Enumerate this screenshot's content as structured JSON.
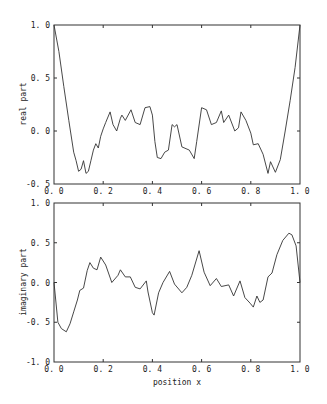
{
  "chart_data": [
    {
      "type": "line",
      "title": "",
      "xlabel": "",
      "ylabel": "real part",
      "xlim": [
        0.0,
        1.0
      ],
      "ylim": [
        -0.5,
        1.0
      ],
      "xticks": [
        "0.0",
        "0.2",
        "0.4",
        "0.6",
        "0.8",
        "1.0"
      ],
      "yticks": [
        "-0.5",
        "0.0",
        "0.5",
        "1.0"
      ],
      "grid": false,
      "legend": null,
      "series": [
        {
          "name": "real part",
          "x": [
            0.0,
            0.02,
            0.04,
            0.06,
            0.08,
            0.09,
            0.1,
            0.11,
            0.12,
            0.13,
            0.14,
            0.15,
            0.16,
            0.17,
            0.18,
            0.19,
            0.2,
            0.21,
            0.228,
            0.24,
            0.255,
            0.27,
            0.276,
            0.29,
            0.313,
            0.33,
            0.35,
            0.37,
            0.39,
            0.4,
            0.41,
            0.42,
            0.435,
            0.45,
            0.465,
            0.48,
            0.49,
            0.5,
            0.52,
            0.55,
            0.57,
            0.58,
            0.6,
            0.62,
            0.64,
            0.66,
            0.68,
            0.69,
            0.71,
            0.735,
            0.75,
            0.76,
            0.78,
            0.8,
            0.81,
            0.83,
            0.85,
            0.87,
            0.88,
            0.9,
            0.92,
            0.94,
            0.96,
            0.98,
            1.0
          ],
          "values": [
            1.0,
            0.75,
            0.42,
            0.1,
            -0.2,
            -0.28,
            -0.38,
            -0.36,
            -0.28,
            -0.4,
            -0.38,
            -0.28,
            -0.18,
            -0.12,
            -0.16,
            -0.05,
            0.02,
            0.08,
            0.18,
            0.06,
            0.0,
            0.12,
            0.15,
            0.1,
            0.2,
            0.08,
            0.06,
            0.22,
            0.23,
            0.15,
            -0.1,
            -0.25,
            -0.26,
            -0.2,
            -0.18,
            0.06,
            0.04,
            0.06,
            -0.15,
            -0.18,
            -0.26,
            -0.1,
            0.22,
            0.2,
            0.06,
            0.08,
            0.19,
            0.08,
            0.15,
            0.0,
            0.03,
            0.18,
            0.1,
            -0.02,
            -0.13,
            -0.12,
            -0.22,
            -0.4,
            -0.29,
            -0.39,
            -0.27,
            0.0,
            0.29,
            0.6,
            1.0
          ]
        }
      ]
    },
    {
      "type": "line",
      "title": "",
      "xlabel": "position x",
      "ylabel": "imaginary part",
      "xlim": [
        0.0,
        1.0
      ],
      "ylim": [
        -1.0,
        1.0
      ],
      "xticks": [
        "0.0",
        "0.2",
        "0.4",
        "0.6",
        "0.8",
        "1.0"
      ],
      "yticks": [
        "-1.0",
        "-0.5",
        "0.0",
        "0.5",
        "1.0"
      ],
      "grid": false,
      "legend": null,
      "series": [
        {
          "name": "imaginary part",
          "x": [
            0.0,
            0.016,
            0.03,
            0.05,
            0.065,
            0.08,
            0.095,
            0.105,
            0.12,
            0.135,
            0.146,
            0.16,
            0.175,
            0.19,
            0.21,
            0.235,
            0.26,
            0.27,
            0.29,
            0.31,
            0.33,
            0.35,
            0.375,
            0.382,
            0.4,
            0.407,
            0.425,
            0.443,
            0.47,
            0.49,
            0.52,
            0.54,
            0.56,
            0.59,
            0.61,
            0.635,
            0.66,
            0.68,
            0.71,
            0.73,
            0.756,
            0.776,
            0.797,
            0.81,
            0.825,
            0.837,
            0.85,
            0.87,
            0.886,
            0.906,
            0.93,
            0.955,
            0.967,
            0.984,
            1.0
          ],
          "values": [
            0.0,
            -0.5,
            -0.58,
            -0.62,
            -0.52,
            -0.37,
            -0.22,
            -0.1,
            -0.07,
            0.15,
            0.25,
            0.18,
            0.16,
            0.32,
            0.22,
            0.0,
            0.09,
            0.16,
            0.07,
            0.07,
            -0.06,
            -0.08,
            0.02,
            -0.12,
            -0.38,
            -0.41,
            -0.13,
            0.0,
            0.14,
            -0.02,
            -0.13,
            -0.06,
            0.09,
            0.4,
            0.13,
            -0.04,
            0.05,
            -0.05,
            -0.03,
            -0.17,
            0.02,
            -0.19,
            -0.26,
            -0.31,
            -0.17,
            -0.25,
            -0.22,
            0.07,
            0.12,
            0.35,
            0.53,
            0.62,
            0.6,
            0.46,
            0.0
          ]
        }
      ]
    }
  ],
  "plots": {
    "top": {
      "ylabel": "real part",
      "xticks": [
        "0.0",
        "0.2",
        "0.4",
        "0.6",
        "0.8",
        "1.0"
      ],
      "yticks": [
        "1.0",
        "0.5",
        "0.0",
        "-0.5"
      ]
    },
    "bottom": {
      "ylabel": "imaginary part",
      "xlabel": "position x",
      "xticks": [
        "0.0",
        "0.2",
        "0.4",
        "0.6",
        "0.8",
        "1.0"
      ],
      "yticks": [
        "1.0",
        "0.5",
        "0.0",
        "-0.5",
        "-1.0"
      ]
    }
  }
}
